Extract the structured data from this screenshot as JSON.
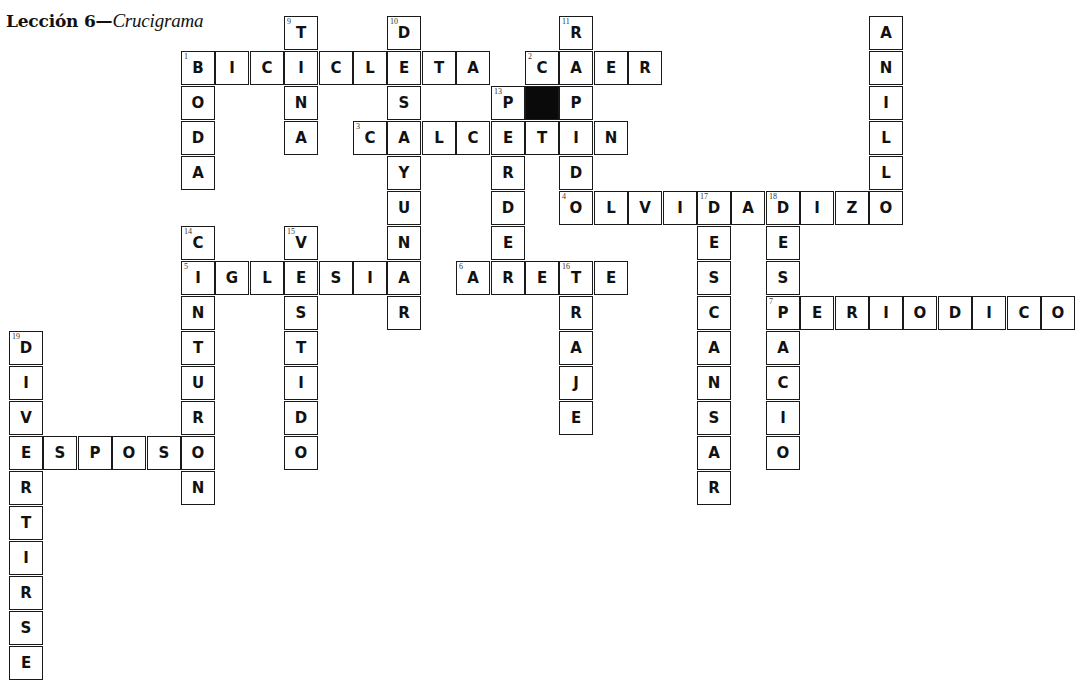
{
  "title": {
    "lesson": "Lección 6—",
    "subtitle": "Crucigrama"
  },
  "layout": {
    "origin_x": 9,
    "origin_y": 16,
    "col_pitch": 34.4,
    "row_pitch": 35
  },
  "words": [
    {
      "num": "1",
      "dir": "across",
      "row": 1,
      "col": 5,
      "answer": "BICICLETA"
    },
    {
      "num": "1",
      "dir": "down",
      "row": 1,
      "col": 5,
      "answer": "BODA"
    },
    {
      "num": "2",
      "dir": "across",
      "row": 1,
      "col": 15,
      "answer": "CAER"
    },
    {
      "num": "3",
      "dir": "across",
      "row": 3,
      "col": 10,
      "answer": "CALCETIN"
    },
    {
      "num": "4",
      "dir": "across",
      "row": 5,
      "col": 16,
      "answer": "OLVIDADIZO"
    },
    {
      "num": "5",
      "dir": "across",
      "row": 7,
      "col": 5,
      "answer": "IGLESIA"
    },
    {
      "num": "6",
      "dir": "across",
      "row": 7,
      "col": 13,
      "answer": "ARETE"
    },
    {
      "num": "7",
      "dir": "across",
      "row": 8,
      "col": 22,
      "answer": "PERIODICO"
    },
    {
      "num": "",
      "dir": "across",
      "row": 12,
      "col": 0,
      "answer": "ESPOSO"
    },
    {
      "num": "9",
      "dir": "down",
      "row": 0,
      "col": 8,
      "answer": "TINA"
    },
    {
      "num": "10",
      "dir": "down",
      "row": 0,
      "col": 11,
      "answer": "DESAYUNAR"
    },
    {
      "num": "11",
      "dir": "down",
      "row": 0,
      "col": 16,
      "answer": "RAPIDO"
    },
    {
      "num": "",
      "dir": "down",
      "row": 0,
      "col": 25,
      "answer": "ANILLO"
    },
    {
      "num": "13",
      "dir": "down",
      "row": 2,
      "col": 14,
      "answer": "PERDER"
    },
    {
      "num": "14",
      "dir": "down",
      "row": 6,
      "col": 5,
      "answer": "CINTURON"
    },
    {
      "num": "15",
      "dir": "down",
      "row": 6,
      "col": 8,
      "answer": "VESTIDO"
    },
    {
      "num": "16",
      "dir": "down",
      "row": 7,
      "col": 16,
      "answer": "TRAJE"
    },
    {
      "num": "17",
      "dir": "down",
      "row": 5,
      "col": 20,
      "answer": "DESCANSAR"
    },
    {
      "num": "18",
      "dir": "down",
      "row": 5,
      "col": 22,
      "answer": "DESPACIO"
    },
    {
      "num": "19",
      "dir": "down",
      "row": 9,
      "col": 0,
      "answer": "DIVERTIRSE"
    }
  ],
  "black_cells": [
    {
      "row": 2,
      "col": 15
    }
  ]
}
